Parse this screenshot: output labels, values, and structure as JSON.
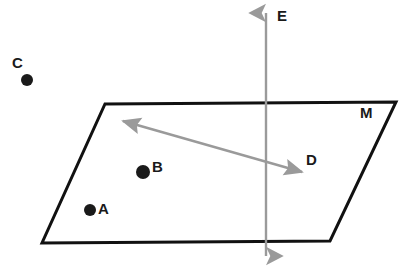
{
  "diagram": {
    "type": "geometry-plane-with-points-and-lines",
    "canvas": {
      "width": 410,
      "height": 269,
      "background": "#ffffff"
    },
    "colors": {
      "plane_stroke": "#111111",
      "plane_fill": "#ffffff",
      "point_fill": "#1a1a1a",
      "line_gray": "#9a9a9a",
      "label_color": "#1a1a1a"
    },
    "plane": {
      "label": "M",
      "label_x": 360,
      "label_y": 105,
      "stroke_width": 3,
      "corners": [
        {
          "x": 105,
          "y": 104
        },
        {
          "x": 396,
          "y": 102
        },
        {
          "x": 330,
          "y": 241
        },
        {
          "x": 42,
          "y": 243
        }
      ]
    },
    "points": [
      {
        "id": "A",
        "label": "A",
        "cx": 90,
        "cy": 210,
        "r": 6,
        "label_x": 98,
        "label_y": 201
      },
      {
        "id": "B",
        "label": "B",
        "cx": 143,
        "cy": 172,
        "r": 7,
        "label_x": 152,
        "label_y": 159
      },
      {
        "id": "C",
        "label": "C",
        "cx": 27,
        "cy": 80,
        "r": 6,
        "label_x": 12,
        "label_y": 55
      }
    ],
    "lines": [
      {
        "id": "E",
        "label": "E",
        "orientation": "vertical",
        "x1": 266,
        "y1": 13,
        "x2": 266,
        "y2": 256,
        "stroke_width": 2.5,
        "double_arrow": true,
        "label_x": 277,
        "label_y": 8
      },
      {
        "id": "D",
        "label": "D",
        "orientation": "diagonal",
        "x1": 123,
        "y1": 121,
        "x2": 302,
        "y2": 172,
        "stroke_width": 2.5,
        "double_arrow": true,
        "label_x": 306,
        "label_y": 152
      }
    ]
  }
}
